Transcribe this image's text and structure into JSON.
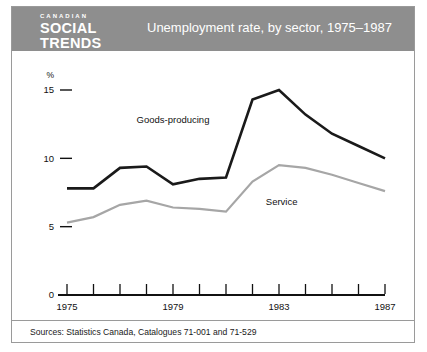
{
  "header": {
    "brand_kicker": "CANADIAN",
    "brand_line1": "SOCIAL",
    "brand_line2": "TRENDS",
    "title": "Unemployment rate, by sector, 1975–1987",
    "background_color": "#8e8e8e",
    "text_color": "#ffffff"
  },
  "footer": {
    "sources": "Sources: Statistics Canada, Catalogues 71-001 and 71-529"
  },
  "chart_data": {
    "type": "line",
    "title": "Unemployment rate, by sector, 1975–1987",
    "xlabel": "",
    "ylabel": "%",
    "x": [
      1975,
      1976,
      1977,
      1978,
      1979,
      1980,
      1981,
      1982,
      1983,
      1984,
      1985,
      1986,
      1987
    ],
    "xtick_labels": [
      "1975",
      "",
      "",
      "",
      "1979",
      "",
      "",
      "",
      "1983",
      "",
      "",
      "",
      "1987"
    ],
    "xlim": [
      1975,
      1987
    ],
    "ylim": [
      0,
      15
    ],
    "yticks": [
      0,
      5,
      10,
      15
    ],
    "ytick_labels": [
      "0",
      "5",
      "10",
      "15"
    ],
    "grid": false,
    "legend": "inline-annotations",
    "series": [
      {
        "name": "Goods-producing",
        "color": "#1a1a1a",
        "width": 2.6,
        "label_x": 1979.0,
        "label_y": 12.55,
        "values": [
          7.8,
          7.8,
          9.3,
          9.4,
          8.1,
          8.5,
          8.6,
          14.3,
          15.0,
          13.2,
          11.8,
          10.9,
          10.0
        ]
      },
      {
        "name": "Service",
        "color": "#a6a6a6",
        "width": 2.2,
        "label_x": 1983.1,
        "label_y": 6.55,
        "values": [
          5.3,
          5.7,
          6.6,
          6.9,
          6.4,
          6.3,
          6.1,
          8.3,
          9.5,
          9.3,
          8.8,
          8.2,
          7.6
        ]
      }
    ]
  },
  "axes": {
    "unit_label": "%",
    "tick_mark_color": "#111111",
    "axis_color": "#111111"
  }
}
